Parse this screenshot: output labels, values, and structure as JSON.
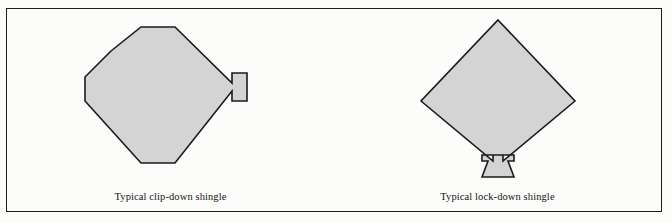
{
  "figure": {
    "background_color": "#fbfbfa",
    "frame_color": "#1d1d1d",
    "shingle_fill": "#d4d4d4",
    "shingle_outline": "#1a1a1a"
  },
  "panels": [
    {
      "id": "clip-down",
      "caption": "Typical clip-down shingle",
      "shape_name": "octagonal-diamond-with-side-clip-tab",
      "description": "Diamond with flattened top, bottom and left corners and a small rectangular clip tab protruding at the right side"
    },
    {
      "id": "lock-down",
      "caption": "Typical lock-down shingle",
      "shape_name": "pointed-diamond-with-bottom-lock-tab",
      "description": "Sharp-cornered diamond with a downward trapezoidal lock tab flanked by two shoulder notches at the bottom vertex"
    }
  ]
}
